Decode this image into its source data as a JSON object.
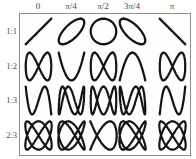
{
  "figure": {
    "background_color": "#ffffff",
    "border_color": "#8d8d8d",
    "curve_color": "#141414",
    "text_color": "#4a4a4a"
  },
  "columns": [
    {
      "label": "0",
      "phase_radians": 0,
      "center_x": 38
    },
    {
      "label": "π/4",
      "phase_radians": 0.7853981634,
      "center_x": 71
    },
    {
      "label": "π/2",
      "phase_radians": 1.5707963268,
      "center_x": 103
    },
    {
      "label": "3π/4",
      "phase_radians": 2.3561944902,
      "center_x": 132
    },
    {
      "label": "π",
      "phase_radians": 3.1415926536,
      "center_x": 172
    }
  ],
  "rows": [
    {
      "label": "1:1",
      "ratio_a": 1,
      "ratio_b": 1,
      "center_y": 31
    },
    {
      "label": "1:2",
      "ratio_a": 1,
      "ratio_b": 2,
      "center_y": 66
    },
    {
      "label": "1:3",
      "ratio_a": 1,
      "ratio_b": 3,
      "center_y": 100
    },
    {
      "label": "2:3",
      "ratio_a": 2,
      "ratio_b": 3,
      "center_y": 135
    }
  ],
  "plot_box": {
    "x": 19,
    "y": 13,
    "width": 172,
    "height": 143
  },
  "cell": {
    "width": 33,
    "height": 33
  },
  "chart_data": {
    "type": "line",
    "xlabel": "phase difference",
    "ylabel": "frequency ratio",
    "grid": false,
    "legend_position": "none",
    "categories": [
      "0",
      "π/4",
      "π/2",
      "3π/4",
      "π"
    ],
    "row_categories": [
      "1:1",
      "1:2",
      "1:3",
      "2:3"
    ],
    "parametric_form": "x = sin(a*t + phase), y = sin(b*t)",
    "series": [
      {
        "name": "1:1",
        "a": 1,
        "b": 1,
        "cells": [
          {
            "phase_label": "0",
            "phase": 0,
            "shape": "diagonal-line-up"
          },
          {
            "phase_label": "π/4",
            "phase": 0.7853981634,
            "shape": "narrow-ellipse-tilted-right"
          },
          {
            "phase_label": "π/2",
            "phase": 1.5707963268,
            "shape": "circle"
          },
          {
            "phase_label": "3π/4",
            "phase": 2.3561944902,
            "shape": "narrow-ellipse-tilted-left"
          },
          {
            "phase_label": "π",
            "phase": 3.1415926536,
            "shape": "diagonal-line-down"
          }
        ]
      },
      {
        "name": "1:2",
        "a": 1,
        "b": 2,
        "cells": [
          {
            "phase_label": "0",
            "phase": 0,
            "shape": "figure-eight-vertical"
          },
          {
            "phase_label": "π/4",
            "phase": 0.7853981634,
            "shape": "open-parabola-left"
          },
          {
            "phase_label": "π/2",
            "phase": 1.5707963268,
            "shape": "figure-eight-vertical"
          },
          {
            "phase_label": "3π/4",
            "phase": 2.3561944902,
            "shape": "open-parabola-right"
          },
          {
            "phase_label": "π",
            "phase": 3.1415926536,
            "shape": "figure-eight-vertical"
          }
        ]
      },
      {
        "name": "1:3",
        "a": 1,
        "b": 3,
        "cells": [
          {
            "phase_label": "0",
            "phase": 0,
            "shape": "s-curve-open"
          },
          {
            "phase_label": "π/4",
            "phase": 0.7853981634,
            "shape": "s-curve-crossed"
          },
          {
            "phase_label": "π/2",
            "phase": 1.5707963268,
            "shape": "triple-loop-braid"
          },
          {
            "phase_label": "3π/4",
            "phase": 2.3561944902,
            "shape": "s-curve-crossed-mirrored"
          },
          {
            "phase_label": "π",
            "phase": 3.1415926536,
            "shape": "s-curve-open-mirrored"
          }
        ]
      },
      {
        "name": "2:3",
        "a": 2,
        "b": 3,
        "cells": [
          {
            "phase_label": "0",
            "phase": 0,
            "shape": "woven-lattice"
          },
          {
            "phase_label": "π/4",
            "phase": 0.7853981634,
            "shape": "woven-bowtie"
          },
          {
            "phase_label": "π/2",
            "phase": 1.5707963268,
            "shape": "open-bowtie"
          },
          {
            "phase_label": "3π/4",
            "phase": 2.3561944902,
            "shape": "woven-bowtie-mirrored"
          },
          {
            "phase_label": "π",
            "phase": 3.1415926536,
            "shape": "woven-lattice-mirrored"
          }
        ]
      }
    ]
  }
}
